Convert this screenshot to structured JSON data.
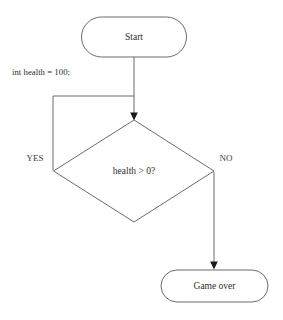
{
  "diagram": {
    "type": "flowchart",
    "background_color": "#ffffff",
    "line_color": "#5a5a5a",
    "text_color": "#2e2e2e",
    "nodes": [
      {
        "id": "start",
        "shape": "stadium",
        "label": "Start",
        "x": 134,
        "y": 37,
        "width": 105,
        "height": 40
      },
      {
        "id": "decision",
        "shape": "diamond",
        "label": "health > 0?",
        "x": 134,
        "y": 171,
        "width": 161,
        "height": 102
      },
      {
        "id": "gameover",
        "shape": "stadium",
        "label": "Game over",
        "x": 214,
        "y": 286,
        "width": 107,
        "height": 32
      }
    ],
    "edges": [
      {
        "id": "start-to-decision",
        "from": "start",
        "to": "decision",
        "label": "int health = 100;",
        "label_x": 12,
        "label_y": 72,
        "arrow": true
      },
      {
        "id": "decision-yes-loop",
        "from": "decision",
        "to": "decision",
        "label": "YES",
        "label_x": 35,
        "label_y": 159,
        "arrow": false
      },
      {
        "id": "decision-no-to-gameover",
        "from": "decision",
        "to": "gameover",
        "label": "NO",
        "label_x": 226,
        "label_y": 159,
        "arrow": true
      }
    ]
  },
  "labels": {
    "start": "Start",
    "decision": "health > 0?",
    "gameover": "Game over",
    "yes": "YES",
    "no": "NO",
    "init_code": "int health = 100;"
  }
}
